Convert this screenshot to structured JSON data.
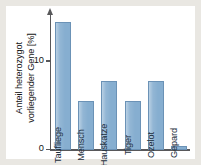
{
  "chart_data": {
    "type": "bar",
    "title": "",
    "xlabel": "",
    "ylabel": "Anteil heterozygot vorliegender Gene [%]",
    "ylabel_line1": "Anteil heterozygot",
    "ylabel_line2": "vorliegender Gene [%]",
    "ylim": [
      0,
      16
    ],
    "ytick_values": [
      0,
      10
    ],
    "ytick_labels": [
      "0",
      "10"
    ],
    "grid": false,
    "legend": "none",
    "bar_color": "#86aed0",
    "bar_border_color": "#6b92b6",
    "axis_color": "#58585a",
    "panel_color": "#ffffff",
    "background_color": "#e9e7e2",
    "categories": [
      "Taufliege",
      "Mensch",
      "Hauskatze",
      "Tiger",
      "Ozelot",
      "Gepard"
    ],
    "values": [
      14.5,
      5.5,
      7.8,
      5.5,
      7.8,
      0.5
    ],
    "bars": [
      {
        "label": "Taufliege",
        "value": 14.5
      },
      {
        "label": "Mensch",
        "value": 5.5
      },
      {
        "label": "Hauskatze",
        "value": 7.8
      },
      {
        "label": "Tiger",
        "value": 5.5
      },
      {
        "label": "Ozelot",
        "value": 7.8
      },
      {
        "label": "Gepard",
        "value": 0.5
      }
    ]
  }
}
